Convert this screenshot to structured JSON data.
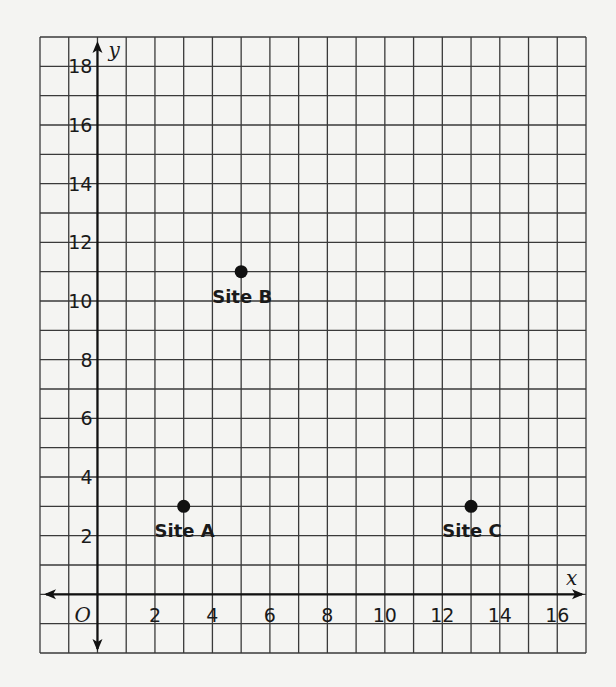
{
  "chart_data": {
    "type": "scatter",
    "title": "",
    "xlabel": "x",
    "ylabel": "y",
    "origin_label": "O",
    "xlim": [
      -2,
      17
    ],
    "ylim": [
      -2,
      19
    ],
    "grid": true,
    "x_ticks": [
      2,
      4,
      6,
      8,
      10,
      12,
      14,
      16
    ],
    "y_ticks": [
      2,
      4,
      6,
      8,
      10,
      12,
      14,
      16,
      18
    ],
    "points": [
      {
        "label": "Site A",
        "x": 3,
        "y": 3
      },
      {
        "label": "Site B",
        "x": 5,
        "y": 11
      },
      {
        "label": "Site C",
        "x": 13,
        "y": 3
      }
    ]
  },
  "colors": {
    "grid": "#3a3a3a",
    "axis": "#111111",
    "point": "#111111",
    "background": "#f4f4f2"
  }
}
